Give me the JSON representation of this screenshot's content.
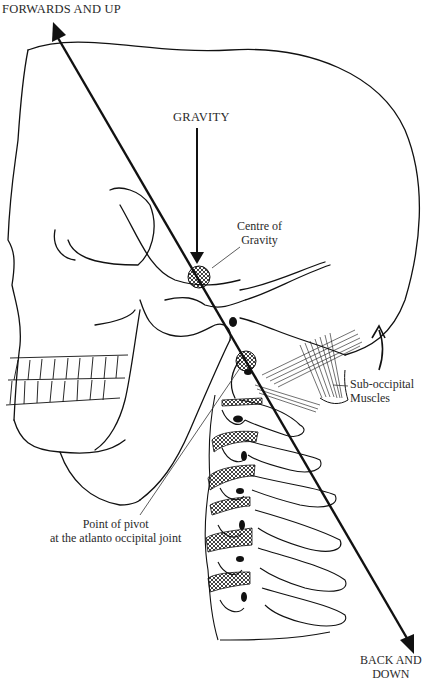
{
  "diagram": {
    "type": "anatomical-illustration",
    "labels": {
      "forwards_and_up": "FORWARDS AND UP",
      "gravity": "GRAVITY",
      "centre_of_gravity": [
        "Centre of",
        "Gravity"
      ],
      "sub_occipital_muscles": [
        "Sub-occipital",
        "Muscles"
      ],
      "point_of_pivot": [
        "Point of pivot",
        "at the atlanto occipital joint"
      ],
      "back_and_down": [
        "BACK AND",
        "DOWN"
      ]
    },
    "colors": {
      "ink": "#111111",
      "background": "#ffffff",
      "label_text": "#2a2a2a"
    }
  }
}
